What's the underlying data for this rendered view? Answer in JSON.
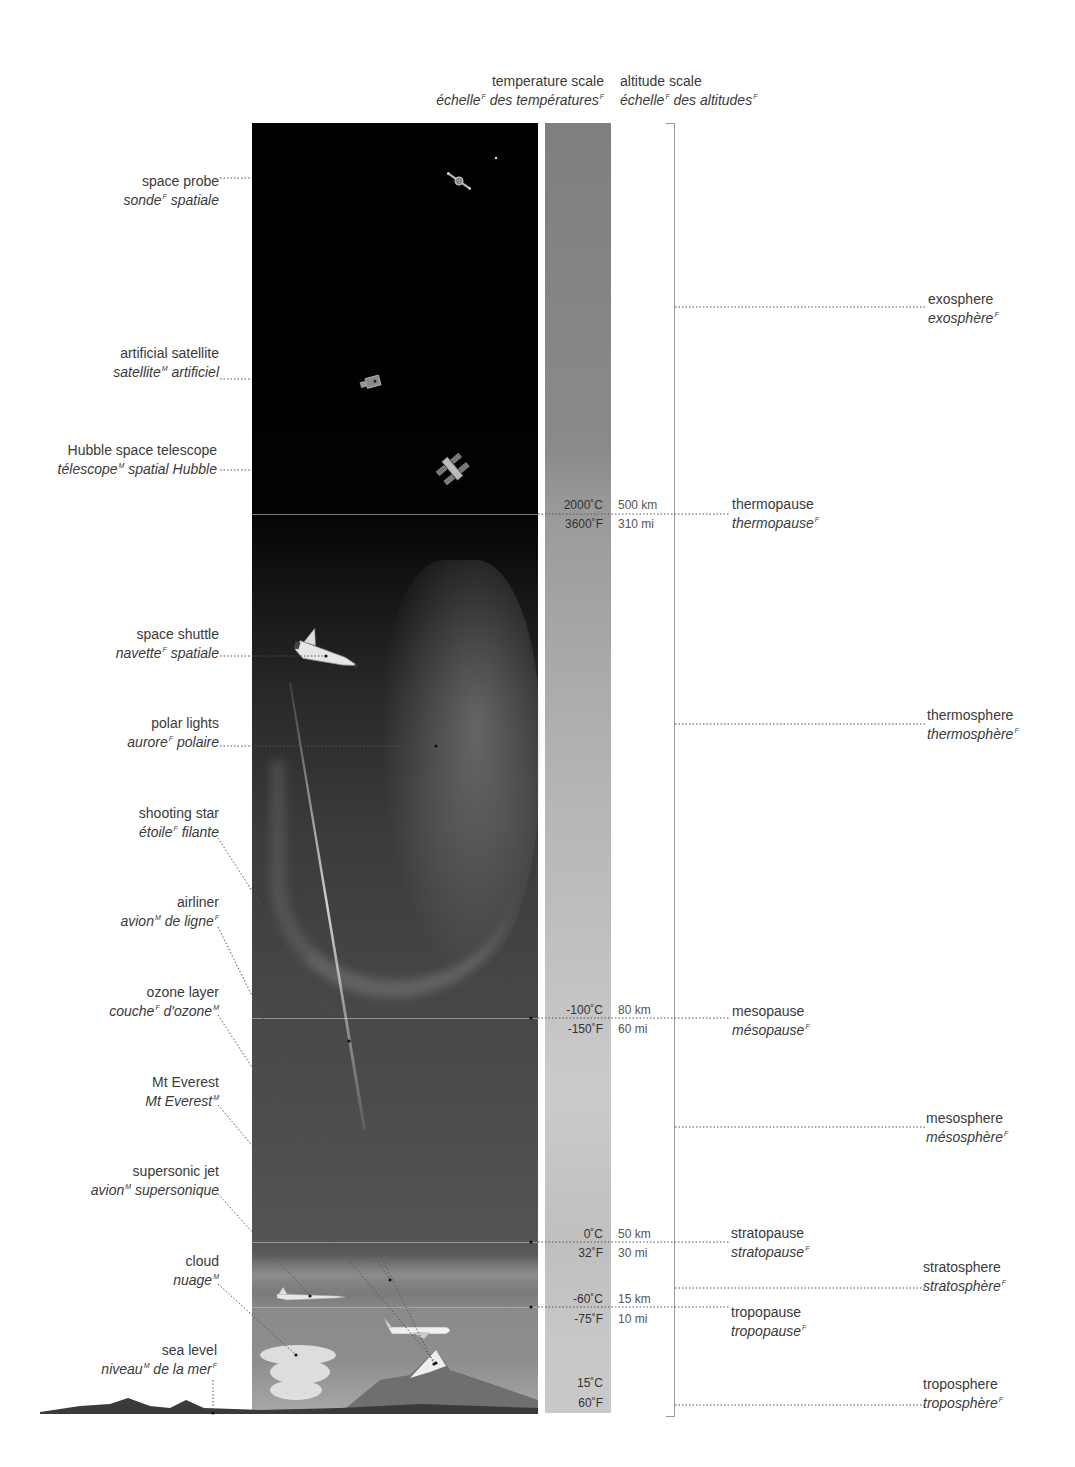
{
  "headers": {
    "temperature_scale": {
      "en": "temperature scale",
      "fr_parts": [
        "échelle",
        "F",
        " des températures",
        "F"
      ]
    },
    "altitude_scale": {
      "en": "altitude scale",
      "fr_parts": [
        "échelle",
        "F",
        " des altitudes",
        "F"
      ]
    }
  },
  "left_labels": [
    {
      "en": "space probe",
      "fr": "sonde",
      "g1": "F",
      "fr2": " spatiale",
      "g2": ""
    },
    {
      "en": "artificial satellite",
      "fr": "satellite",
      "g1": "M",
      "fr2": " artificiel",
      "g2": ""
    },
    {
      "en": "Hubble space telescope",
      "fr": "télescope",
      "g1": "M",
      "fr2": " spatial Hubble",
      "g2": ""
    },
    {
      "en": "space shuttle",
      "fr": "navette",
      "g1": "F",
      "fr2": " spatiale",
      "g2": ""
    },
    {
      "en": "polar lights",
      "fr": "aurore",
      "g1": "F",
      "fr2": " polaire",
      "g2": ""
    },
    {
      "en": "shooting star",
      "fr": "étoile",
      "g1": "F",
      "fr2": " filante",
      "g2": ""
    },
    {
      "en": "airliner",
      "fr": "avion",
      "g1": "M",
      "fr2": " de ligne",
      "g2": "F"
    },
    {
      "en": "ozone layer",
      "fr": "couche",
      "g1": "F",
      "fr2": " d'ozone",
      "g2": "M"
    },
    {
      "en": "Mt Everest",
      "fr": "Mt Everest",
      "g1": "M",
      "fr2": "",
      "g2": ""
    },
    {
      "en": "supersonic jet",
      "fr": "avion",
      "g1": "M",
      "fr2": " supersonique",
      "g2": ""
    },
    {
      "en": "cloud",
      "fr": "nuage",
      "g1": "M",
      "fr2": "",
      "g2": ""
    },
    {
      "en": "sea level",
      "fr": "niveau",
      "g1": "M",
      "fr2": " de la mer",
      "g2": "F"
    }
  ],
  "boundaries": [
    {
      "temp_c": "2000˚C",
      "temp_f": "3600˚F",
      "alt_km": "500 km",
      "alt_mi": "310 mi",
      "en": "thermopause",
      "fr": "thermopause",
      "g": "F"
    },
    {
      "temp_c": "-100˚C",
      "temp_f": "-150˚F",
      "alt_km": "80 km",
      "alt_mi": "60 mi",
      "en": "mesopause",
      "fr": "mésopause",
      "g": "F"
    },
    {
      "temp_c": "0˚C",
      "temp_f": "32˚F",
      "alt_km": "50 km",
      "alt_mi": "30 mi",
      "en": "stratopause",
      "fr": "stratopause",
      "g": "F"
    },
    {
      "temp_c": "-60˚C",
      "temp_f": "-75˚F",
      "alt_km": "15 km",
      "alt_mi": "10 mi",
      "en": "tropopause",
      "fr": "tropopause",
      "g": "F"
    }
  ],
  "surface": {
    "temp_c": "15˚C",
    "temp_f": "60˚F"
  },
  "layers": [
    {
      "en": "exosphere",
      "fr": "exosphère",
      "g": "F"
    },
    {
      "en": "thermosphere",
      "fr": "thermosphère",
      "g": "F"
    },
    {
      "en": "mesosphere",
      "fr": "mésosphère",
      "g": "F"
    },
    {
      "en": "stratosphere",
      "fr": "stratosphère",
      "g": "F"
    },
    {
      "en": "troposphere",
      "fr": "troposphère",
      "g": "F"
    }
  ]
}
